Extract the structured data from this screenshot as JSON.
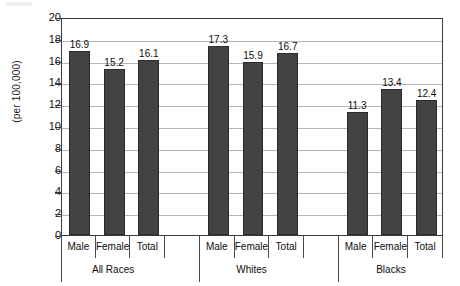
{
  "chart_data": {
    "type": "bar",
    "title": "",
    "xlabel": "",
    "ylabel": "(per 100,000)",
    "ylim": [
      0,
      20
    ],
    "ytick_step": 2,
    "yticks": [
      20,
      18,
      16,
      14,
      12,
      10,
      8,
      6,
      4,
      2,
      0
    ],
    "grid": true,
    "legend": "none",
    "categories": [
      "Male",
      "Female",
      "Total"
    ],
    "groups": [
      "All Races",
      "Whites",
      "Blacks"
    ],
    "series": [
      {
        "name": "All Races",
        "values": [
          16.9,
          15.2,
          16.1
        ]
      },
      {
        "name": "Whites",
        "values": [
          17.3,
          15.9,
          16.7
        ]
      },
      {
        "name": "Blacks",
        "values": [
          11.3,
          13.4,
          12.4
        ]
      }
    ],
    "bars": [
      {
        "group": "All Races",
        "category": "Male",
        "value": 16.9,
        "label": "16.9"
      },
      {
        "group": "All Races",
        "category": "Female",
        "value": 15.2,
        "label": "15.2"
      },
      {
        "group": "All Races",
        "category": "Total",
        "value": 16.1,
        "label": "16.1"
      },
      {
        "group": "Whites",
        "category": "Male",
        "value": 17.3,
        "label": "17.3"
      },
      {
        "group": "Whites",
        "category": "Female",
        "value": 15.9,
        "label": "15.9"
      },
      {
        "group": "Whites",
        "category": "Total",
        "value": 16.7,
        "label": "16.7"
      },
      {
        "group": "Blacks",
        "category": "Male",
        "value": 11.3,
        "label": "11.3"
      },
      {
        "group": "Blacks",
        "category": "Female",
        "value": 13.4,
        "label": "13.4"
      },
      {
        "group": "Blacks",
        "category": "Total",
        "value": 12.4,
        "label": "12.4"
      }
    ],
    "colors": {
      "bar_fill": "#434343",
      "bar_border": "#2b2b2b",
      "gridline": "#b6b6b6",
      "axis": "#3a3a3a",
      "background": "#ffffff",
      "text": "#0d0d0d"
    }
  }
}
